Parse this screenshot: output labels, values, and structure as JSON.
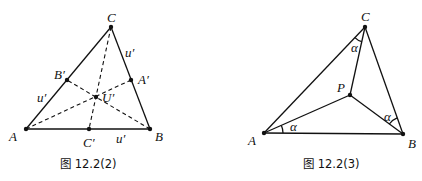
{
  "figures": [
    {
      "caption": "图 12.2(2)",
      "points": {
        "A": {
          "label": "A",
          "x": 26,
          "y": 129
        },
        "B": {
          "label": "B",
          "x": 150,
          "y": 129
        },
        "C": {
          "label": "C",
          "x": 111,
          "y": 27
        },
        "A_prime": {
          "label": "A′",
          "x": 131,
          "y": 80
        },
        "B_prime": {
          "label": "B′",
          "x": 67,
          "y": 80
        },
        "C_prime": {
          "label": "C′",
          "x": 89,
          "y": 129
        },
        "U_prime": {
          "label": "U′",
          "x": 96,
          "y": 97
        }
      },
      "side_labels": {
        "left": "u′",
        "right": "u′",
        "bottom": "u′"
      }
    },
    {
      "caption": "图 12.2(3)",
      "points": {
        "A": {
          "label": "A",
          "x": 264,
          "y": 133
        },
        "B": {
          "label": "B",
          "x": 403,
          "y": 134
        },
        "C": {
          "label": "C",
          "x": 365,
          "y": 27
        },
        "P": {
          "label": "P",
          "x": 350,
          "y": 95
        }
      },
      "angle_labels": {
        "at_A": "α",
        "at_B": "α",
        "at_C": "α"
      }
    }
  ]
}
